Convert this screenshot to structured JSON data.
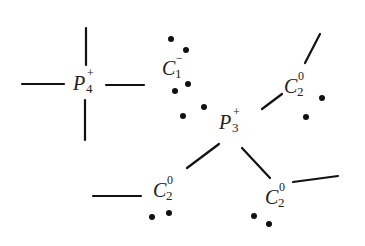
{
  "diagram": {
    "colors": {
      "ink": "#111111",
      "background": "#ffffff"
    },
    "atoms": [
      {
        "id": "P4",
        "element": "P",
        "subscript": "4",
        "superscript": "+",
        "x": 73,
        "y": 90
      },
      {
        "id": "C1",
        "element": "C",
        "subscript": "1",
        "superscript": "−",
        "x": 162,
        "y": 75
      },
      {
        "id": "P3",
        "element": "P",
        "subscript": "3",
        "superscript": "+",
        "x": 219,
        "y": 129
      },
      {
        "id": "C2_upper_right",
        "element": "C",
        "subscript": "2",
        "superscript": "0",
        "x": 284,
        "y": 93
      },
      {
        "id": "C2_lower_left",
        "element": "C",
        "subscript": "2",
        "superscript": "0",
        "x": 153,
        "y": 197
      },
      {
        "id": "C2_lower_right",
        "element": "C",
        "subscript": "2",
        "superscript": "0",
        "x": 265,
        "y": 204
      }
    ],
    "bonds": [
      {
        "id": "P4-left",
        "x1": 22,
        "y1": 84,
        "x2": 64,
        "y2": 84
      },
      {
        "id": "P4-top",
        "x1": 86,
        "y1": 28,
        "x2": 86,
        "y2": 65
      },
      {
        "id": "P4-right",
        "x1": 106,
        "y1": 85,
        "x2": 144,
        "y2": 85
      },
      {
        "id": "P4-bottom",
        "x1": 85,
        "y1": 100,
        "x2": 85,
        "y2": 140
      },
      {
        "id": "C2ur-top",
        "x1": 320,
        "y1": 34,
        "x2": 305,
        "y2": 63
      },
      {
        "id": "P3-C2ur",
        "x1": 262,
        "y1": 109,
        "x2": 282,
        "y2": 94
      },
      {
        "id": "P3-C2ll",
        "x1": 187,
        "y1": 168,
        "x2": 219,
        "y2": 144
      },
      {
        "id": "C2ll-left",
        "x1": 93,
        "y1": 196,
        "x2": 141,
        "y2": 196
      },
      {
        "id": "P3-C2lr",
        "x1": 242,
        "y1": 148,
        "x2": 270,
        "y2": 178
      },
      {
        "id": "C2lr-right",
        "x1": 293,
        "y1": 182,
        "x2": 338,
        "y2": 176
      }
    ],
    "electron_dots": [
      {
        "group": "C1",
        "x": 171,
        "y": 39
      },
      {
        "group": "C1",
        "x": 186,
        "y": 50
      },
      {
        "group": "C1",
        "x": 188,
        "y": 84
      },
      {
        "group": "C1",
        "x": 175,
        "y": 91
      },
      {
        "group": "C1",
        "x": 204,
        "y": 107
      },
      {
        "group": "C1",
        "x": 183,
        "y": 116
      },
      {
        "group": "C2_upper_right",
        "x": 322,
        "y": 98
      },
      {
        "group": "C2_upper_right",
        "x": 306,
        "y": 117
      },
      {
        "group": "C2_lower_left",
        "x": 152,
        "y": 217
      },
      {
        "group": "C2_lower_left",
        "x": 169,
        "y": 213
      },
      {
        "group": "C2_lower_right",
        "x": 254,
        "y": 216
      },
      {
        "group": "C2_lower_right",
        "x": 269,
        "y": 224
      }
    ]
  }
}
